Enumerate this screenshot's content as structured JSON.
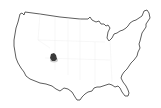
{
  "map": {
    "region": "United States (contiguous)",
    "style": "outline",
    "outline_color": "#333333",
    "background": "#ffffff",
    "state_border_color": "#ececec"
  },
  "marker": {
    "icon": "location-marker-icon",
    "color": "#3a3a3a",
    "approx_state": "Colorado / Utah border area",
    "x": 54,
    "y": 58
  }
}
